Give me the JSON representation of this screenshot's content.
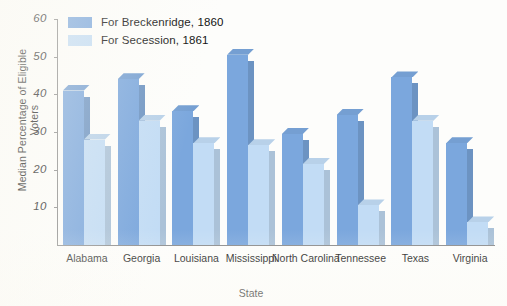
{
  "chart_data": {
    "type": "bar",
    "title": "",
    "xlabel": "State",
    "ylabel": "Median Percentage of Eligible Voters",
    "categories": [
      "Alabama",
      "Georgia",
      "Louisiana",
      "Mississippi",
      "North Carolina",
      "Tennessee",
      "Texas",
      "Virginia"
    ],
    "series": [
      {
        "name": "For Breckenridge, 1860",
        "color": "#7ba7dd",
        "values": [
          41,
          44,
          35.5,
          50.5,
          29.5,
          34.5,
          44.5,
          27
        ]
      },
      {
        "name": "For Secession, 1861",
        "color": "#c2dcf5",
        "values": [
          28,
          33,
          27,
          26.5,
          21.5,
          10.5,
          33,
          6
        ]
      }
    ],
    "ylim": [
      0,
      60
    ],
    "yticks": [
      10,
      20,
      30,
      40,
      50,
      60
    ],
    "ytick_labels": [
      "10",
      "20",
      "30",
      "40",
      "50",
      "60"
    ],
    "grid": false,
    "legend_position": "top-left"
  },
  "legend": {
    "items": [
      {
        "label": "For Breckenridge, 1860",
        "color": "#7ba7dd"
      },
      {
        "label": "For Secession, 1861",
        "color": "#c2dcf5"
      }
    ]
  },
  "axes": {
    "y_title": "Median Percentage of Eligible Voters",
    "x_title": "State"
  }
}
